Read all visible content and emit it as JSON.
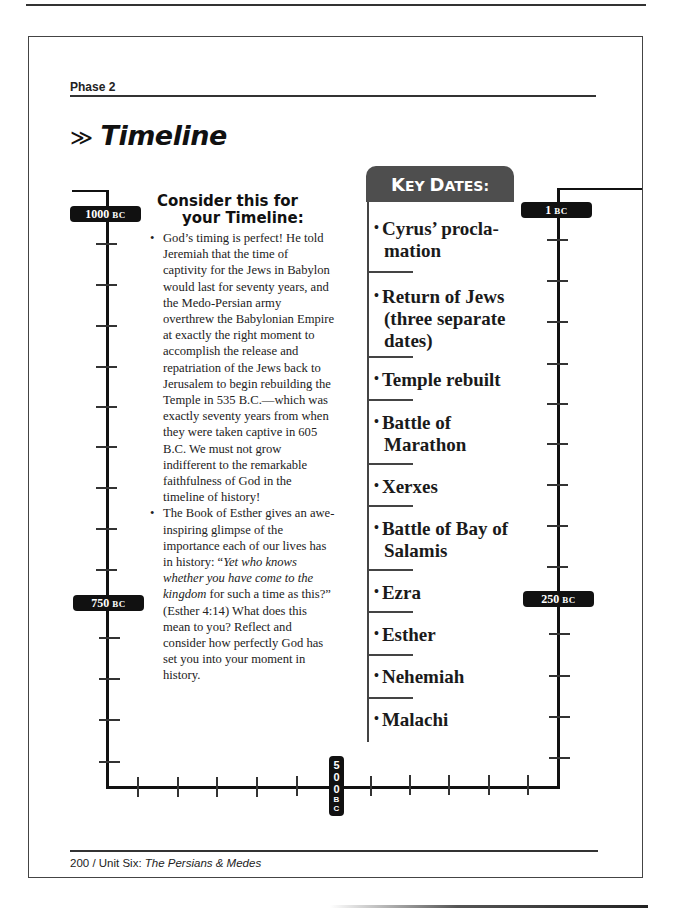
{
  "header": {
    "section": "Phase 2",
    "title_arrow": "≫",
    "title": "Timeline"
  },
  "consider": {
    "heading_line1": "Consider this for",
    "heading_line2": "your Timeline:",
    "bullet1": "God’s timing is perfect! He told Jeremiah that the time of captivity for the Jews in Babylon would last for seventy years, and the Medo-Persian army overthrew the Babylonian Empire at exactly the right moment to accomplish the release and repatriation of the Jews back to Jerusalem to begin rebuilding the Temple in 535 B.C.—which was exactly seventy years from when they were taken captive in 605 B.C. We must not grow indifferent to the remarkable faithfulness of God in the timeline of history!",
    "bullet2_pre": "The Book of Esther gives an awe-inspiring glimpse of the importance each of our lives has in history: “",
    "bullet2_italic": "Yet who knows whether you have come to the kingdom",
    "bullet2_post": " for such a time as this?” (Esther 4:14) What does this mean to you? Reflect and consider how perfectly God has set you into your moment in history."
  },
  "key_dates": {
    "heading_first": "K",
    "heading_rest": "EY ",
    "heading_first2": "D",
    "heading_rest2": "ATES:",
    "items": [
      {
        "l1": "Cyrus’ procla-",
        "l2": "mation"
      },
      {
        "l1": "Return of Jews",
        "l2": "(three separate",
        "l3": "dates)"
      },
      {
        "l1": "Temple rebuilt"
      },
      {
        "l1": "Battle of",
        "l2": "Marathon"
      },
      {
        "l1": "Xerxes"
      },
      {
        "l1": "Battle of Bay of",
        "l2": "Salamis"
      },
      {
        "l1": "Ezra"
      },
      {
        "l1": "Esther"
      },
      {
        "l1": "Nehemiah"
      },
      {
        "l1": "Malachi"
      }
    ]
  },
  "timeline": {
    "label_1000": {
      "num": "1000",
      "era": "BC"
    },
    "label_750": {
      "num": "750",
      "era": "BC"
    },
    "label_500": {
      "d1": "5",
      "d2": "0",
      "d3": "0",
      "e1": "B",
      "e2": "C"
    },
    "label_250": {
      "num": "250",
      "era": "BC"
    },
    "label_1": {
      "num": "1",
      "era": "BC"
    }
  },
  "footer": {
    "page": "200",
    "sep": " / ",
    "unit": "Unit Six: ",
    "unit_title": "The Persians & Medes"
  }
}
